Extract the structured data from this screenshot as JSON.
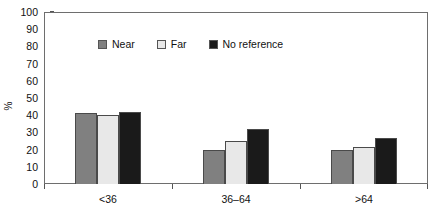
{
  "chart_data": {
    "type": "bar",
    "title": "",
    "subtitle": "",
    "xlabel": "",
    "ylabel": "%",
    "ylim": [
      0,
      100
    ],
    "ytick_step": 10,
    "yticks": [
      100,
      90,
      80,
      70,
      60,
      50,
      40,
      30,
      20,
      10,
      0
    ],
    "categories": [
      "<36",
      "36–64",
      ">64"
    ],
    "grid": false,
    "legend_position": "inside-top-center",
    "series": [
      {
        "name": "Near",
        "color": "#808080",
        "values": [
          41,
          20,
          20
        ]
      },
      {
        "name": "Far",
        "color": "#e8e8e8",
        "values": [
          40,
          25,
          21.5
        ]
      },
      {
        "name": "No reference",
        "color": "#1a1a1a",
        "values": [
          42,
          32,
          26.5
        ]
      }
    ],
    "annotations": []
  },
  "axes": {
    "y_title": "%",
    "y_tick_labels": [
      "100",
      "90",
      "80",
      "70",
      "60",
      "50",
      "40",
      "30",
      "20",
      "10",
      "0"
    ],
    "x_tick_labels": [
      "<36",
      "36–64",
      ">64"
    ]
  },
  "legend": {
    "entries": [
      {
        "label": "Near",
        "swatch_color": "#808080"
      },
      {
        "label": "Far",
        "swatch_color": "#e8e8e8"
      },
      {
        "label": "No reference",
        "swatch_color": "#1a1a1a"
      }
    ]
  },
  "style": {
    "frame_color": "#6e6e6e",
    "bar_border_color": "#4a4a4a",
    "background": "#ffffff",
    "text_color": "#111111"
  }
}
